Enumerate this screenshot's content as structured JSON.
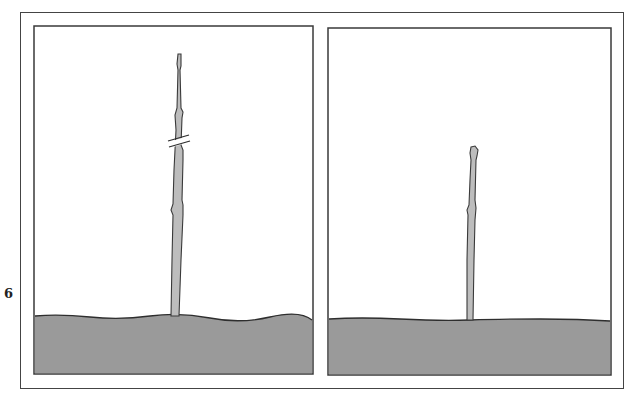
{
  "figure": {
    "label": "6",
    "panels": [
      {
        "id": "before",
        "description": "Tall stem with pruning cut mark",
        "has_cut_mark": true
      },
      {
        "id": "after",
        "description": "Stem after pruning, shortened",
        "has_cut_mark": false
      }
    ]
  },
  "colors": {
    "soil": "#9a9a9a",
    "stem": "#bdbdbd",
    "outline": "#3a3a3a",
    "background": "#ffffff"
  }
}
